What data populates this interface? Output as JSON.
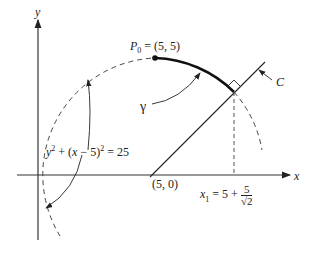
{
  "axes": {
    "x_label": "x",
    "y_label": "y"
  },
  "labels": {
    "p0": "P",
    "p0_sub": "0",
    "p0_value": " = (5, 5)",
    "gamma": "γ",
    "line_c": "C",
    "circle_eq_y": "y",
    "circle_eq_rest_a": " + (",
    "circle_eq_x": "x",
    "circle_eq_rest_b": " − 5)",
    "circle_eq_end": " = 25",
    "sup2": "2",
    "origin_point": "(5, 0)",
    "x1_name": "x",
    "x1_sub": "1",
    "x1_eq": " = 5 + ",
    "x1_num": "5",
    "x1_den": "√2"
  },
  "colors": {
    "ink": "#222222",
    "dashed": "#555555",
    "background": "#ffffff"
  },
  "geometry": {
    "circle_center": [
      5,
      0
    ],
    "circle_radius": 5,
    "p0": [
      5,
      5
    ],
    "tangent_point_x": "5 + 5/√2"
  }
}
